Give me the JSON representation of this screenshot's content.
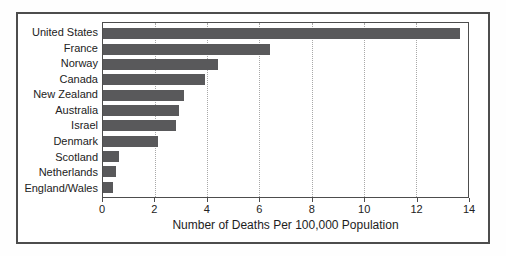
{
  "chart_data": {
    "type": "bar",
    "orientation": "horizontal",
    "categories": [
      "United States",
      "France",
      "Norway",
      "Canada",
      "New Zealand",
      "Australia",
      "Israel",
      "Denmark",
      "Scotland",
      "Netherlands",
      "England/Wales"
    ],
    "values": [
      13.7,
      6.4,
      4.4,
      3.9,
      3.1,
      2.9,
      2.8,
      2.1,
      0.6,
      0.5,
      0.4
    ],
    "title": "",
    "xlabel": "Number of Deaths Per 100,000 Population",
    "ylabel": "",
    "xlim": [
      0,
      14
    ],
    "xticks": [
      0,
      2,
      4,
      6,
      8,
      10,
      12,
      14
    ],
    "grid": "vertical-dotted",
    "legend": "none",
    "colors": {
      "bar": "#59595b",
      "outer_frame": "#4d4d4d",
      "plot_border": "#4d4d4d",
      "gridline": "#a8a8a8",
      "text": "#222222",
      "background": "#ffffff"
    }
  }
}
